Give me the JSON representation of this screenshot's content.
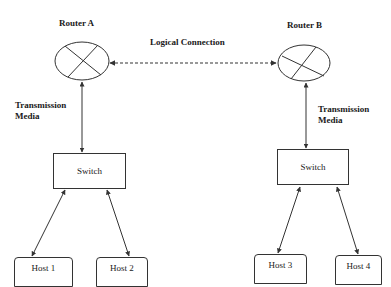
{
  "diagram": {
    "routers": [
      {
        "id": "router-a",
        "label": "Router A"
      },
      {
        "id": "router-b",
        "label": "Router B"
      }
    ],
    "logical_connection": {
      "label": "Logical Connection"
    },
    "transmission_media": [
      {
        "label_line1": "Transmission",
        "label_line2": "Media"
      },
      {
        "label_line1": "Transmission",
        "label_line2": "Media"
      }
    ],
    "switches": [
      {
        "label": "Switch"
      },
      {
        "label": "Switch"
      }
    ],
    "hosts": [
      {
        "label": "Host 1"
      },
      {
        "label": "Host 2"
      },
      {
        "label": "Host 3"
      },
      {
        "label": "Host 4"
      }
    ],
    "colors": {
      "stroke": "#333333",
      "text": "#1a1a1a",
      "background": "#ffffff"
    }
  }
}
